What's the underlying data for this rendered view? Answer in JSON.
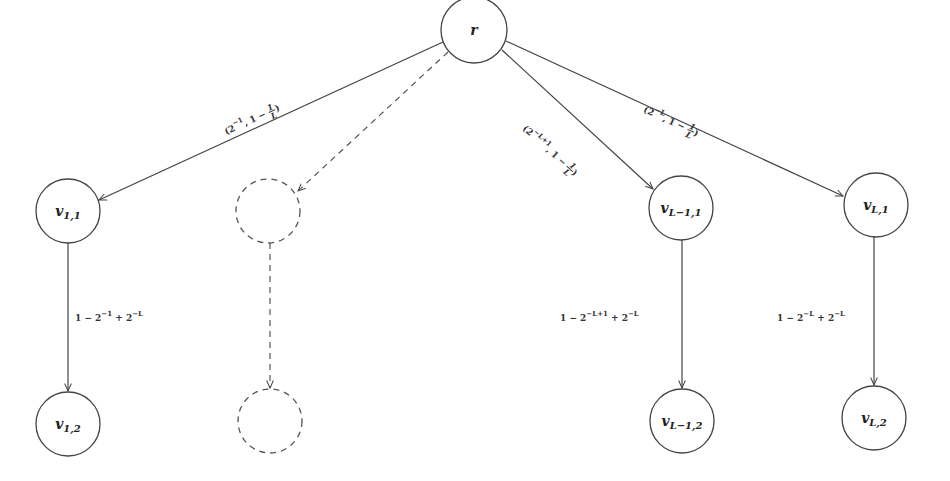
{
  "diagram": {
    "type": "tree",
    "nodes": {
      "root": {
        "label": "r"
      },
      "v11": {
        "label": "v",
        "sub": "1,1"
      },
      "v12": {
        "label": "v",
        "sub": "1,2"
      },
      "vL1_1": {
        "label": "v",
        "sub": "L−1,1"
      },
      "vL1_2": {
        "label": "v",
        "sub": "L−1,2"
      },
      "vL_1": {
        "label": "v",
        "sub": "L,1"
      },
      "vL_2": {
        "label": "v",
        "sub": "L,2"
      },
      "ellipsis_top": {
        "label": ""
      },
      "ellipsis_bottom": {
        "label": ""
      }
    },
    "edges": {
      "root_v11": {
        "open": "(2",
        "exp": "−1",
        "mid": ", 1 − ",
        "num": "1",
        "den": "L",
        "close": ")"
      },
      "root_vL1_1": {
        "open": "(2",
        "exp": "−L+1",
        "mid": ", 1 − ",
        "num": "1",
        "den": "L",
        "close": ")"
      },
      "root_vL_1": {
        "open": "(2",
        "exp": "−L",
        "mid": ", 1 − ",
        "num": "1",
        "den": "L",
        "close": ")"
      },
      "v11_v12": {
        "a": "1 − 2",
        "exp1": "−1",
        "b": " + 2",
        "exp2": "−L"
      },
      "vL1_1_vL1_2": {
        "a": "1 − 2",
        "exp1": "−L+1",
        "b": " + 2",
        "exp2": "−L"
      },
      "vL_1_vL_2": {
        "a": "1 − 2",
        "exp1": "−L",
        "b": " + 2",
        "exp2": "−L"
      }
    },
    "colors": {
      "stroke": "#444444",
      "background": "#ffffff"
    }
  }
}
